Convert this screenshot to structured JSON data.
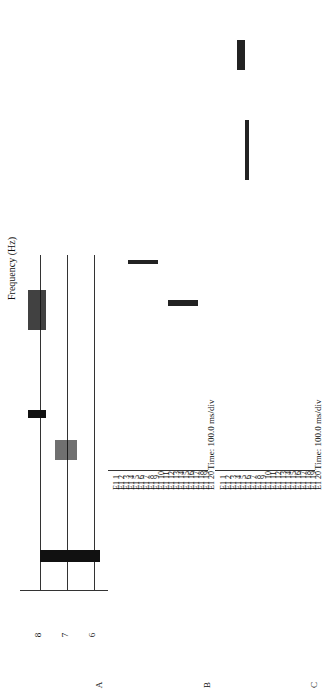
{
  "panels": {
    "A": {
      "letter": "A",
      "ylabel": "Frequency (Hz)",
      "xlabel": "Time (ms)",
      "x_ticks": [
        "0",
        "800"
      ],
      "y_ticks": [
        "8",
        "7",
        "6",
        "5",
        "4",
        "3",
        "2",
        "1",
        "0"
      ]
    },
    "B": {
      "letter": "B",
      "electrodes": [
        "E1 1",
        "E1 2",
        "E1 3",
        "E1 4",
        "E1 5",
        "E1 6",
        "E1 7",
        "E1 8",
        "E1 9",
        "E1 10",
        "E1 11",
        "E1 12",
        "E1 13",
        "E1 14",
        "E1 15",
        "E1 16",
        "E1 17",
        "E1 18",
        "E1 19",
        "E1 20"
      ],
      "scale": "Time: 100.0 ms/div"
    },
    "C": {
      "letter": "C",
      "electrodes": [
        "E1 1",
        "E1 2",
        "E1 3",
        "E1 4",
        "E1 5",
        "E1 6",
        "E1 7",
        "E1 8",
        "E1 9",
        "E1 10",
        "E1 11",
        "E1 12",
        "E1 13",
        "E1 14",
        "E1 15",
        "E1 16",
        "E1 17",
        "E1 18",
        "E1 19",
        "E1 20"
      ],
      "scale": "Time: 100.0 ms/div"
    }
  }
}
